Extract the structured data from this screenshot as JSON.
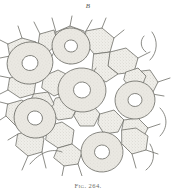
{
  "plate": {
    "panel_label": "B",
    "caption": "Fig. 264.",
    "background_color": "#ffffff",
    "ink_color": "#6e6e68",
    "stipple_fill_color": "#e9e7e2",
    "ring_fill_color": "#e4e1db",
    "hole_fill_color": "#ffffff",
    "line_width": 0.8
  },
  "drawing": {
    "type": "cell-mosaic-line-drawing",
    "description": "Stippled polygonal cell mosaic with large annular ring cells",
    "ring_cells": [
      {
        "id": "ring-upper-left",
        "cx": 30,
        "cy": 51,
        "rx": 23,
        "ry": 21,
        "hole_rx": 8,
        "hole_ry": 7.5,
        "rotation": -12
      },
      {
        "id": "ring-upper-middle",
        "cx": 71,
        "cy": 34,
        "rx": 19,
        "ry": 18,
        "hole_rx": 6.5,
        "hole_ry": 6,
        "rotation": 8
      },
      {
        "id": "ring-center",
        "cx": 82,
        "cy": 78,
        "rx": 24,
        "ry": 22,
        "hole_rx": 8.5,
        "hole_ry": 8,
        "rotation": 5
      },
      {
        "id": "ring-right",
        "cx": 135,
        "cy": 88,
        "rx": 20,
        "ry": 19,
        "hole_rx": 7,
        "hole_ry": 6.5,
        "rotation": -6
      },
      {
        "id": "ring-lower-left",
        "cx": 35,
        "cy": 106,
        "rx": 21,
        "ry": 20,
        "hole_rx": 7.5,
        "hole_ry": 7,
        "rotation": 14
      },
      {
        "id": "ring-lower-middle",
        "cx": 102,
        "cy": 140,
        "rx": 21,
        "ry": 20,
        "hole_rx": 7.5,
        "hole_ry": 7,
        "rotation": -4
      }
    ],
    "polygon_cells": [
      {
        "id": "cell-01",
        "points": "56,20 70,14 84,19 86,32 72,38 58,32"
      },
      {
        "id": "cell-02",
        "points": "86,19 102,16 114,26 110,40 94,42 86,32"
      },
      {
        "id": "cell-03",
        "points": "110,40 126,36 138,46 134,60 118,62 108,54"
      },
      {
        "id": "cell-04",
        "points": "94,42 110,40 108,54 118,62 106,70 92,62"
      },
      {
        "id": "cell-05",
        "points": "134,60 150,58 158,70 152,82 138,84 130,72"
      },
      {
        "id": "cell-06",
        "points": "8,32 22,26 36,30 38,44 24,50 10,44"
      },
      {
        "id": "cell-07",
        "points": "10,66 24,62 36,68 34,82 20,86 8,78"
      },
      {
        "id": "cell-08",
        "points": "44,64 58,58 70,64 68,78 54,84 42,76"
      },
      {
        "id": "cell-09",
        "points": "56,86 70,84 78,94 72,106 58,108 50,98"
      },
      {
        "id": "cell-10",
        "points": "78,94 92,92 100,102 94,114 80,114 74,104"
      },
      {
        "id": "cell-11",
        "points": "100,102 114,98 124,108 118,120 104,122 98,112"
      },
      {
        "id": "cell-12",
        "points": "124,108 138,106 148,116 142,128 128,128 122,118"
      },
      {
        "id": "cell-13",
        "points": "8,92 22,88 32,96 30,110 16,114 6,104"
      },
      {
        "id": "cell-14",
        "points": "18,122 32,118 44,126 42,140 28,144 16,134"
      },
      {
        "id": "cell-15",
        "points": "48,114 62,110 74,118 72,132 58,136 46,128"
      },
      {
        "id": "cell-16",
        "points": "58,136 72,132 82,140 78,152 64,154 54,146"
      },
      {
        "id": "cell-17",
        "points": "122,118 136,116 148,124 146,138 132,142 122,132"
      },
      {
        "id": "cell-18",
        "points": "126,60 138,56 146,64 142,74 130,76 124,68"
      },
      {
        "id": "cell-19",
        "points": "40,22 54,18 58,32 48,40 38,36"
      },
      {
        "id": "cell-20",
        "points": "34,82 48,80 54,92 46,102 34,100 30,90"
      }
    ],
    "free_arcs": [
      {
        "id": "arc-top-right-fragment",
        "d": "M 144 24 C 140 28 140 36 146 40"
      },
      {
        "id": "arc-top-right-outer",
        "d": "M 152 20 C 158 28 158 40 150 48"
      },
      {
        "id": "arc-bottom-left",
        "d": "M 30 152 C 40 140 52 136 62 140"
      },
      {
        "id": "arc-bottom-right",
        "d": "M 150 132 C 156 142 154 152 146 158"
      },
      {
        "id": "arc-right-edge",
        "d": "M 160 96 C 168 104 168 116 160 124"
      }
    ],
    "free_edges": [
      {
        "id": "edge-t1",
        "d": "M 56 20 L 52 6"
      },
      {
        "id": "edge-t2",
        "d": "M 70 14 L 72 4"
      },
      {
        "id": "edge-t3",
        "d": "M 86 19 L 92 8"
      },
      {
        "id": "edge-t4",
        "d": "M 102 16 L 106 6"
      },
      {
        "id": "edge-t5",
        "d": "M 40 22 L 34 10"
      },
      {
        "id": "edge-t6",
        "d": "M 22 26 L 18 14"
      },
      {
        "id": "edge-t7",
        "d": "M 114 26 L 124 18"
      },
      {
        "id": "edge-l1",
        "d": "M 8 32 L 0 28"
      },
      {
        "id": "edge-l2",
        "d": "M 10 44 L 0 46"
      },
      {
        "id": "edge-l3",
        "d": "M 10 66 L 0 64"
      },
      {
        "id": "edge-l4",
        "d": "M 8 78 L 0 82"
      },
      {
        "id": "edge-l5",
        "d": "M 8 92 L 0 90"
      },
      {
        "id": "edge-l6",
        "d": "M 6 104 L 0 108"
      },
      {
        "id": "edge-l7",
        "d": "M 18 122 L 8 128"
      },
      {
        "id": "edge-r1",
        "d": "M 158 70 L 170 66"
      },
      {
        "id": "edge-r2",
        "d": "M 152 82 L 164 84"
      },
      {
        "id": "edge-r3",
        "d": "M 148 116 L 160 112"
      },
      {
        "id": "edge-r4",
        "d": "M 146 138 L 158 142"
      },
      {
        "id": "edge-r5",
        "d": "M 138 46 L 150 40"
      },
      {
        "id": "edge-b1",
        "d": "M 28 144 L 22 158"
      },
      {
        "id": "edge-b2",
        "d": "M 42 140 L 46 156"
      },
      {
        "id": "edge-b3",
        "d": "M 64 154 L 62 164"
      },
      {
        "id": "edge-b4",
        "d": "M 78 152 L 82 164"
      },
      {
        "id": "edge-b5",
        "d": "M 132 142 L 136 156"
      },
      {
        "id": "edge-b6",
        "d": "M 104 122 L 104 120"
      },
      {
        "id": "edge-m1",
        "d": "M 46 102 L 40 110"
      },
      {
        "id": "edge-m2",
        "d": "M 92 62 L 96 56"
      },
      {
        "id": "edge-m3",
        "d": "M 72 38 L 70 52"
      },
      {
        "id": "edge-m4",
        "d": "M 58 32 L 52 44"
      }
    ]
  }
}
